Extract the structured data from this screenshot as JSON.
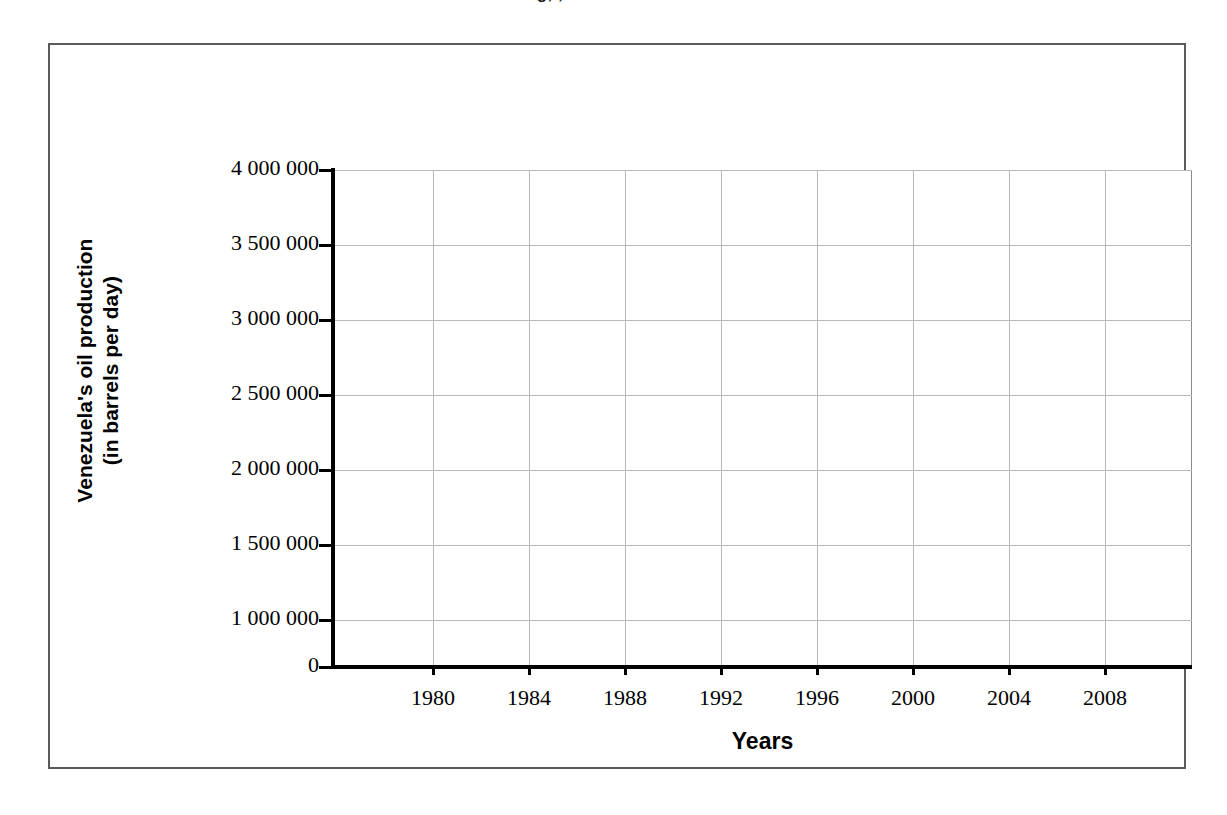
{
  "figure": {
    "title_fragment": "g, ,",
    "frame_color": "#5a5a5a",
    "background": "#ffffff",
    "grid_color": "#b8b8b8",
    "axis_color": "#000000"
  },
  "chart_data": {
    "type": "line",
    "title": "",
    "subtitle": "",
    "xlabel": "Years",
    "ylabel": "Venezuela's oil production\n(in barrels per day)",
    "ylabel_line1": "Venezuela's oil production",
    "ylabel_line2": "(in barrels per day)",
    "grid": true,
    "legend": null,
    "series": [],
    "x": [],
    "values": [],
    "categories": [],
    "note": "Empty grid template — axes and gridlines drawn, no data series plotted.",
    "xlim": [
      1978,
      2010
    ],
    "ylim": [
      0,
      4000000
    ],
    "x_ticks": [
      1980,
      1984,
      1988,
      1992,
      1996,
      2000,
      2004,
      2008
    ],
    "x_tick_labels": [
      "1980",
      "1984",
      "1988",
      "1992",
      "1996",
      "2000",
      "2004",
      "2008"
    ],
    "y_ticks": [
      4000000,
      3500000,
      3000000,
      2500000,
      2000000,
      1500000,
      1000000,
      0
    ],
    "y_tick_labels": [
      "4 000 000",
      "3 500 000",
      "3 000 000",
      "2 500 000",
      "2 000 000",
      "1 500 000",
      "1 000 000",
      "0"
    ],
    "y_tick_pixel_offsets": [
      0,
      75,
      150,
      225,
      300,
      375,
      450,
      497
    ],
    "x_tick_pixel_offsets": [
      100,
      196,
      292,
      388,
      484,
      580,
      676,
      772
    ],
    "gridline_h_offsets": [
      0,
      75,
      150,
      225,
      300,
      375,
      450
    ],
    "gridline_v_offsets": [
      100,
      196,
      292,
      388,
      484,
      580,
      676,
      772
    ]
  }
}
